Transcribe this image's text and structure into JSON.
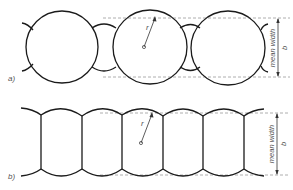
{
  "figure": {
    "panel_a": {
      "label": "a)",
      "radius_label": "r",
      "dimension_label": "mean width",
      "dimension_symbol": "b"
    },
    "panel_b": {
      "label": "b)",
      "radius_label": "r",
      "dimension_label": "mean width",
      "dimension_symbol": "b"
    }
  },
  "colors": {
    "line": "#1a1a1a",
    "dashed": "#9a9a9a",
    "text": "#555555",
    "background": "#ffffff"
  }
}
